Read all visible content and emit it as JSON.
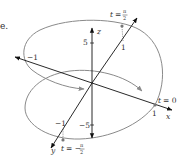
{
  "caption_fragment": "e.",
  "colors": {
    "axis": "#111111",
    "curve": "#8a8a8a",
    "label": "#333333",
    "point": "#777777"
  },
  "axes": {
    "x": {
      "label": "x",
      "tick_pos": "1",
      "tick_neg": "−1"
    },
    "y": {
      "label": "y",
      "tick_pos": "1",
      "tick_neg": "−1"
    },
    "z": {
      "label": "z",
      "tick_pos": "5",
      "tick_neg": "−5"
    }
  },
  "points": [
    {
      "name": "t-zero",
      "label_t": "t",
      "label_eq": "= 0"
    },
    {
      "name": "t-half-pi",
      "label_t": "t",
      "label_eq": "=",
      "num": "π",
      "den": "2"
    },
    {
      "name": "t-neg-half-pi",
      "label_t": "t",
      "label_eq": "= −",
      "num": "π",
      "den": "2"
    }
  ]
}
